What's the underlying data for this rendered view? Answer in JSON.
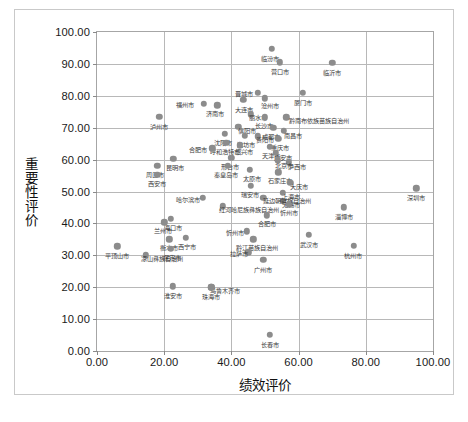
{
  "chart_data": {
    "type": "scatter",
    "title": "",
    "xlabel": "绩效评价",
    "ylabel": "重要性评价",
    "xlim": [
      0,
      100
    ],
    "ylim": [
      0,
      100
    ],
    "xticks": [
      "0.00",
      "20.00",
      "40.00",
      "60.00",
      "80.00",
      "100.00"
    ],
    "yticks": [
      "0.00",
      "10.00",
      "20.00",
      "30.00",
      "40.00",
      "50.00",
      "60.00",
      "70.00",
      "80.00",
      "90.00",
      "100.00"
    ],
    "grid": true,
    "legend": "none",
    "point_color": "#8c8c8c",
    "points": [
      {
        "label": "泸州市",
        "x": 18.5,
        "y": 73.5,
        "lx": 0,
        "ly": 7
      },
      {
        "label": "福州市",
        "x": 31.8,
        "y": 77.5,
        "lx": -19,
        "ly": -2
      },
      {
        "label": "济南市",
        "x": 35.8,
        "y": 77.0,
        "lx": -2,
        "ly": 6
      },
      {
        "label": "大连市",
        "x": 43.6,
        "y": 78.8,
        "lx": 1,
        "ly": 7
      },
      {
        "label": "丽水市",
        "x": 45.8,
        "y": 74.2,
        "lx": 7,
        "ly": 1
      },
      {
        "label": "临汾市",
        "x": 52.0,
        "y": 94.8,
        "lx": -2,
        "ly": 7
      },
      {
        "label": "营口市",
        "x": 54.4,
        "y": 90.5,
        "lx": 0,
        "ly": 7
      },
      {
        "label": "临沂市",
        "x": 70.0,
        "y": 90.3,
        "lx": 0,
        "ly": 7
      },
      {
        "label": "晋城市",
        "x": 47.8,
        "y": 81.0,
        "lx": -14,
        "ly": -2
      },
      {
        "label": "沧州市",
        "x": 50.0,
        "y": 79.2,
        "lx": 5,
        "ly": 5
      },
      {
        "label": "厦门市",
        "x": 61.3,
        "y": 81.0,
        "lx": 0,
        "ly": 7
      },
      {
        "label": "长沙市",
        "x": 50.0,
        "y": 73.3,
        "lx": -1,
        "ly": 6
      },
      {
        "label": "黔南布依族苗族自治州",
        "x": 56.3,
        "y": 73.3,
        "lx": 33,
        "ly": 1
      },
      {
        "label": "信阳市",
        "x": 42.0,
        "y": 70.3,
        "lx": 9,
        "ly": 1
      },
      {
        "label": "沈阳市",
        "x": 38.0,
        "y": 68.0,
        "lx": -2,
        "ly": 6
      },
      {
        "label": "成都市",
        "x": 52.5,
        "y": 70.0,
        "lx": -2,
        "ly": 6
      },
      {
        "label": "呼和浩特市",
        "x": 38.5,
        "y": 65.3,
        "lx": -1,
        "ly": 6
      },
      {
        "label": "潍坊市",
        "x": 44.0,
        "y": 67.5,
        "lx": 1,
        "ly": 6
      },
      {
        "label": "南昌市",
        "x": 55.6,
        "y": 69.0,
        "lx": 9,
        "ly": 2
      },
      {
        "label": "贵阳市",
        "x": 47.8,
        "y": 67.3,
        "lx": 7,
        "ly": 1
      },
      {
        "label": "绍兴市",
        "x": 42.5,
        "y": 64.5,
        "lx": 4,
        "ly": 4
      },
      {
        "label": "重庆市",
        "x": 54.0,
        "y": 66.5,
        "lx": 2,
        "ly": 6
      },
      {
        "label": "天津市",
        "x": 51.5,
        "y": 64.0,
        "lx": 1,
        "ly": 6
      },
      {
        "label": "合肥市",
        "x": 34.3,
        "y": 63.5,
        "lx": -14,
        "ly": -1
      },
      {
        "label": "广安市",
        "x": 53.2,
        "y": 62.2,
        "lx": 7,
        "ly": 2
      },
      {
        "label": "昆明市",
        "x": 22.7,
        "y": 60.3,
        "lx": 2,
        "ly": 6
      },
      {
        "label": "周口市",
        "x": 18.0,
        "y": 58.0,
        "lx": -2,
        "ly": 6
      },
      {
        "label": "西安市",
        "x": 18.0,
        "y": 55.3,
        "lx": 0,
        "ly": 6
      },
      {
        "label": "邢台市",
        "x": 40.0,
        "y": 60.5,
        "lx": -1,
        "ly": 6
      },
      {
        "label": "秦皇岛市",
        "x": 39.0,
        "y": 58.0,
        "lx": -2,
        "ly": 6
      },
      {
        "label": "太原市",
        "x": 45.5,
        "y": 56.8,
        "lx": 2,
        "ly": 6
      },
      {
        "label": "泸西市",
        "x": 57.0,
        "y": 59.2,
        "lx": 8,
        "ly": 2
      },
      {
        "label": "北京市",
        "x": 53.8,
        "y": 59.8,
        "lx": 6,
        "ly": 3
      },
      {
        "label": "石家庄市",
        "x": 54.0,
        "y": 56.0,
        "lx": 2,
        "ly": 6
      },
      {
        "label": "瑞安市",
        "x": 45.8,
        "y": 51.8,
        "lx": -1,
        "ly": 6
      },
      {
        "label": "大庆市",
        "x": 57.5,
        "y": 52.8,
        "lx": 9,
        "ly": 1
      },
      {
        "label": "上海市",
        "x": 55.3,
        "y": 49.5,
        "lx": 8,
        "ly": 1
      },
      {
        "label": "无锡市",
        "x": 55.3,
        "y": 47.0,
        "lx": 8,
        "ly": 1
      },
      {
        "label": "深圳市",
        "x": 95.0,
        "y": 51.0,
        "lx": 0,
        "ly": 7
      },
      {
        "label": "淄博市",
        "x": 73.5,
        "y": 45.0,
        "lx": 0,
        "ly": 7
      },
      {
        "label": "哈尔滨市",
        "x": 31.5,
        "y": 48.0,
        "lx": -15,
        "ly": -1
      },
      {
        "label": "延边朝鲜族自治州",
        "x": 49.5,
        "y": 48.0,
        "lx": 24,
        "ly": 0
      },
      {
        "label": "红河哈尼族彝族自治州",
        "x": 37.5,
        "y": 45.3,
        "lx": 26,
        "ly": 1
      },
      {
        "label": "忻州市",
        "x": 57.0,
        "y": 46.0,
        "lx": 0,
        "ly": 6
      },
      {
        "label": "海口市",
        "x": 22.0,
        "y": 41.5,
        "lx": 2,
        "ly": 6
      },
      {
        "label": "兰州市",
        "x": 20.0,
        "y": 40.3,
        "lx": -1,
        "ly": 6
      },
      {
        "label": "合肥市",
        "x": 50.5,
        "y": 42.5,
        "lx": 0,
        "ly": 6
      },
      {
        "label": "衡水市",
        "x": 21.5,
        "y": 35.0,
        "lx": 0,
        "ly": 6
      },
      {
        "label": "西宁市",
        "x": 26.5,
        "y": 35.5,
        "lx": 1,
        "ly": 6
      },
      {
        "label": "保定市",
        "x": 22.0,
        "y": 32.0,
        "lx": 1,
        "ly": 6
      },
      {
        "label": "平顶山市",
        "x": 6.0,
        "y": 32.8,
        "lx": 0,
        "ly": 7
      },
      {
        "label": "凉山彝族自治州",
        "x": 14.5,
        "y": 30.0,
        "lx": 16,
        "ly": 1
      },
      {
        "label": "忻州市",
        "x": 44.5,
        "y": 37.5,
        "lx": -12,
        "ly": -1
      },
      {
        "label": "黔江苗族自治州",
        "x": 46.5,
        "y": 35.0,
        "lx": 4,
        "ly": 6
      },
      {
        "label": "武汉市",
        "x": 63.0,
        "y": 36.5,
        "lx": 0,
        "ly": 7
      },
      {
        "label": "拉萨市",
        "x": 45.0,
        "y": 31.0,
        "lx": -9,
        "ly": -1
      },
      {
        "label": "杭州市",
        "x": 76.5,
        "y": 33.0,
        "lx": -1,
        "ly": 7
      },
      {
        "label": "广州市",
        "x": 49.5,
        "y": 28.5,
        "lx": 0,
        "ly": 7
      },
      {
        "label": "乌鲁木齐市",
        "x": 34.0,
        "y": 20.0,
        "lx": 14,
        "ly": 1
      },
      {
        "label": "淮安市",
        "x": 22.5,
        "y": 20.3,
        "lx": 0,
        "ly": 7
      },
      {
        "label": "珠海市",
        "x": 34.0,
        "y": 20.0,
        "lx": 0,
        "ly": 7
      },
      {
        "label": "长春市",
        "x": 51.5,
        "y": 5.0,
        "lx": 0,
        "ly": 7
      }
    ]
  }
}
